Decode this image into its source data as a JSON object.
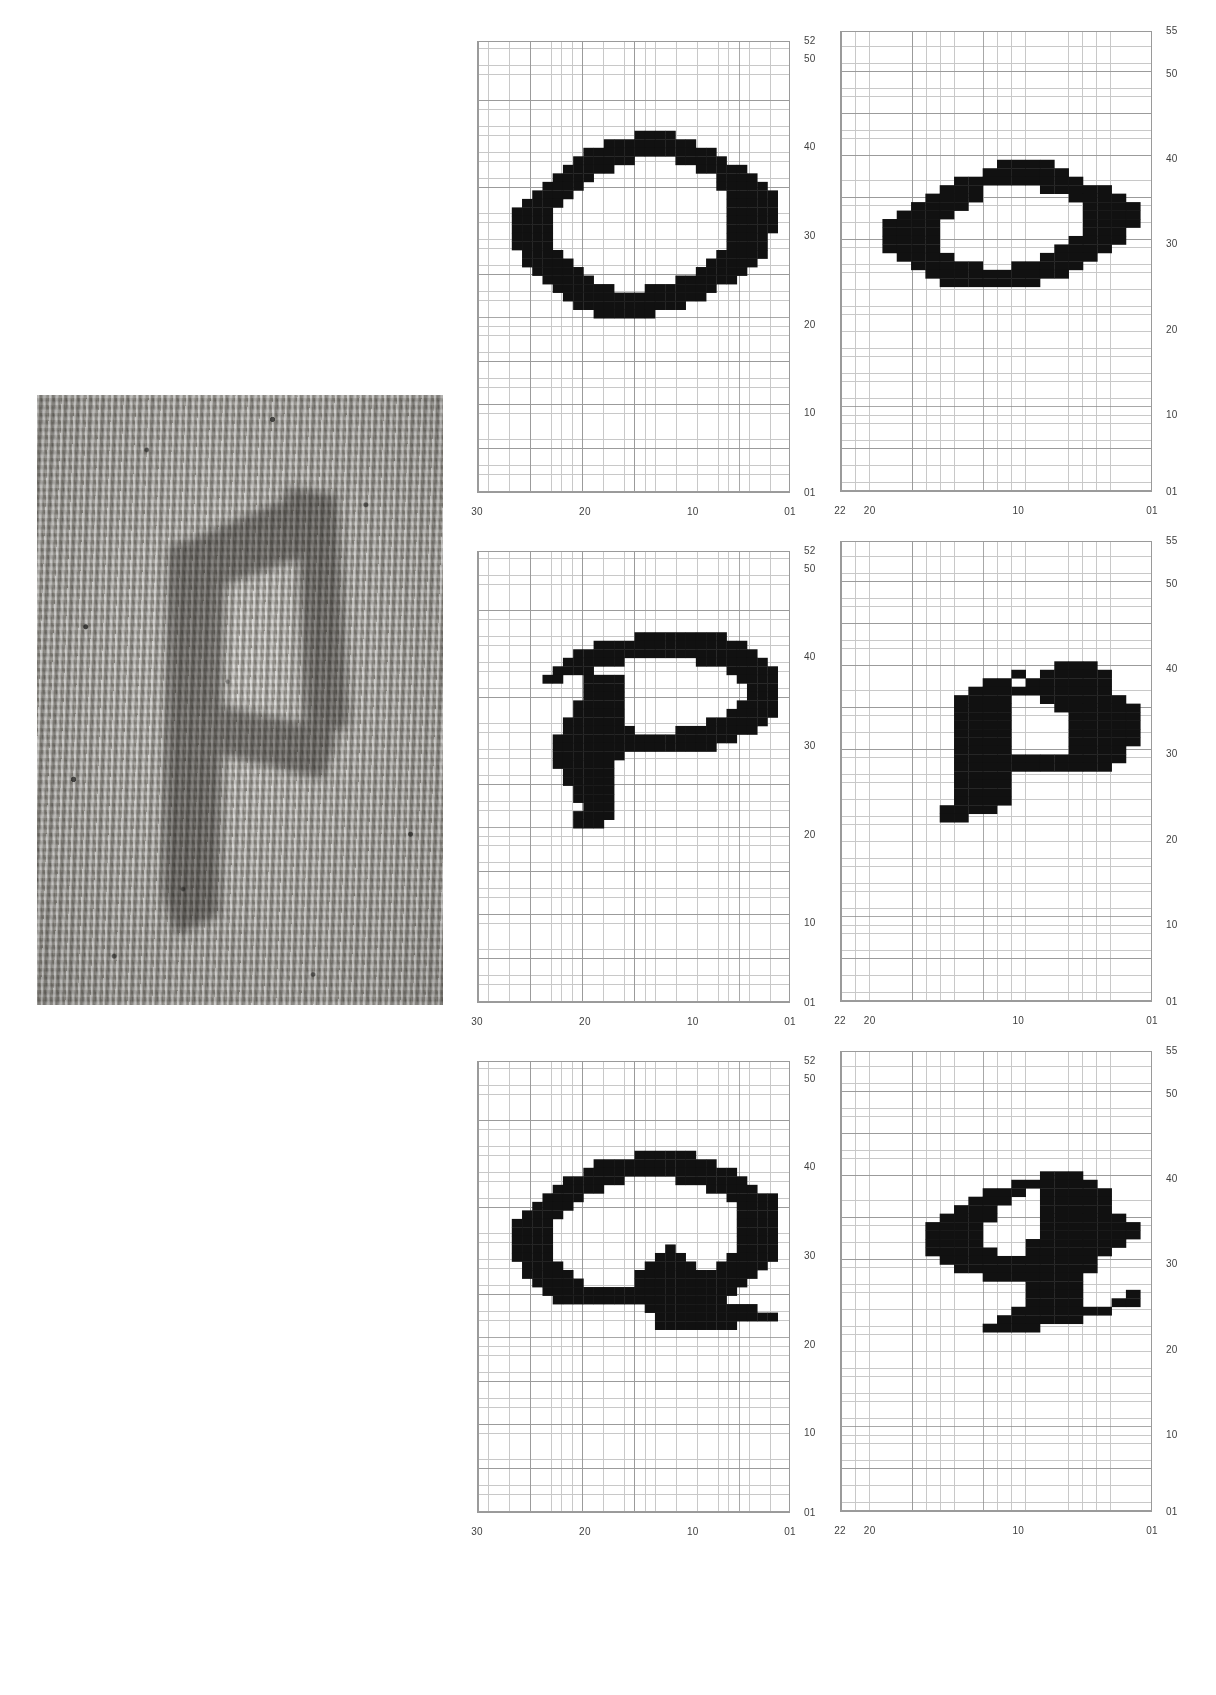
{
  "figure": {
    "background_color": "#ffffff",
    "cell_color": "#111111",
    "grid_minor_color": "#c8c8c8",
    "grid_major_color": "#8c8c8c",
    "axis_text_color": "#3f3f3f"
  },
  "photo": {
    "name": "knitted-fabric-swatch",
    "description": "Grayscale photograph of a stockinette knitted fabric swatch with a dark knitted lowercase p letterform",
    "letter_depicted": "p"
  },
  "charts": [
    {
      "id": "chart-O-upper",
      "glyph": "O",
      "case": "uppercase",
      "row": 0,
      "column": 0,
      "x_ticks": [
        "30",
        "20",
        "10",
        "01"
      ],
      "y_ticks": [
        "52",
        "50",
        "40",
        "30",
        "20",
        "10",
        "01"
      ],
      "x_range": [
        1,
        30
      ],
      "y_range": [
        1,
        52
      ],
      "grid": true
    },
    {
      "id": "chart-o-lower",
      "glyph": "o",
      "case": "lowercase",
      "row": 0,
      "column": 1,
      "x_ticks": [
        "22",
        "20",
        "10",
        "01"
      ],
      "y_ticks": [
        "55",
        "50",
        "40",
        "30",
        "20",
        "10",
        "01"
      ],
      "x_range": [
        1,
        22
      ],
      "y_range": [
        1,
        55
      ],
      "grid": true
    },
    {
      "id": "chart-P-upper",
      "glyph": "P",
      "case": "uppercase",
      "row": 1,
      "column": 0,
      "x_ticks": [
        "30",
        "20",
        "10",
        "01"
      ],
      "y_ticks": [
        "52",
        "50",
        "40",
        "30",
        "20",
        "10",
        "01"
      ],
      "x_range": [
        1,
        30
      ],
      "y_range": [
        1,
        52
      ],
      "grid": true
    },
    {
      "id": "chart-p-lower",
      "glyph": "p",
      "case": "lowercase",
      "row": 1,
      "column": 1,
      "x_ticks": [
        "22",
        "20",
        "10",
        "01"
      ],
      "y_ticks": [
        "55",
        "50",
        "40",
        "30",
        "20",
        "10",
        "01"
      ],
      "x_range": [
        1,
        22
      ],
      "y_range": [
        1,
        55
      ],
      "grid": true
    },
    {
      "id": "chart-Q-upper",
      "glyph": "Q",
      "case": "uppercase",
      "row": 2,
      "column": 0,
      "x_ticks": [
        "30",
        "20",
        "10",
        "01"
      ],
      "y_ticks": [
        "52",
        "50",
        "40",
        "30",
        "20",
        "10",
        "01"
      ],
      "x_range": [
        1,
        30
      ],
      "y_range": [
        1,
        52
      ],
      "grid": true
    },
    {
      "id": "chart-q-lower",
      "glyph": "q",
      "case": "lowercase",
      "row": 2,
      "column": 1,
      "x_ticks": [
        "22",
        "20",
        "10",
        "01"
      ],
      "y_ticks": [
        "55",
        "50",
        "40",
        "30",
        "20",
        "10",
        "01"
      ],
      "x_range": [
        1,
        22
      ],
      "y_range": [
        1,
        55
      ],
      "grid": true
    }
  ],
  "chart_data": {
    "type": "heatmap",
    "title": "",
    "xlabel": "",
    "ylabel": "",
    "panels": [
      {
        "name": "O",
        "xlim": [
          1,
          30
        ],
        "ylim": [
          1,
          52
        ],
        "xticks": [
          30,
          20,
          10,
          1
        ],
        "xticklabels": [
          "30",
          "20",
          "10",
          "01"
        ],
        "yticks": [
          52,
          50,
          40,
          30,
          20,
          10,
          1
        ],
        "yticklabels": [
          "52",
          "50",
          "40",
          "30",
          "20",
          "10",
          "01"
        ],
        "filled_cell_count": 118
      },
      {
        "name": "o",
        "xlim": [
          1,
          22
        ],
        "ylim": [
          1,
          55
        ],
        "xticks": [
          22,
          20,
          10,
          1
        ],
        "xticklabels": [
          "22",
          "20",
          "10",
          "01"
        ],
        "yticks": [
          55,
          50,
          40,
          30,
          20,
          10,
          1
        ],
        "yticklabels": [
          "55",
          "50",
          "40",
          "30",
          "20",
          "10",
          "01"
        ],
        "filled_cell_count": 84
      },
      {
        "name": "P",
        "xlim": [
          1,
          30
        ],
        "ylim": [
          1,
          52
        ],
        "xticks": [
          30,
          20,
          10,
          1
        ],
        "xticklabels": [
          "30",
          "20",
          "10",
          "01"
        ],
        "yticks": [
          52,
          50,
          40,
          30,
          20,
          10,
          1
        ],
        "yticklabels": [
          "52",
          "50",
          "40",
          "30",
          "20",
          "10",
          "01"
        ],
        "filled_cell_count": 132
      },
      {
        "name": "p",
        "xlim": [
          1,
          22
        ],
        "ylim": [
          1,
          55
        ],
        "xticks": [
          22,
          20,
          10,
          1
        ],
        "xticklabels": [
          "22",
          "20",
          "10",
          "01"
        ],
        "yticks": [
          55,
          50,
          40,
          30,
          20,
          10,
          1
        ],
        "yticklabels": [
          "55",
          "50",
          "40",
          "30",
          "20",
          "10",
          "01"
        ],
        "filled_cell_count": 110
      },
      {
        "name": "Q",
        "xlim": [
          1,
          30
        ],
        "ylim": [
          1,
          52
        ],
        "xticks": [
          30,
          20,
          10,
          1
        ],
        "xticklabels": [
          "30",
          "20",
          "10",
          "01"
        ],
        "yticks": [
          52,
          50,
          40,
          30,
          20,
          10,
          1
        ],
        "yticklabels": [
          "52",
          "50",
          "40",
          "30",
          "20",
          "10",
          "01"
        ],
        "filled_cell_count": 140
      },
      {
        "name": "q",
        "xlim": [
          1,
          22
        ],
        "ylim": [
          1,
          55
        ],
        "xticks": [
          22,
          20,
          10,
          1
        ],
        "xticklabels": [
          "22",
          "20",
          "10",
          "01"
        ],
        "yticks": [
          55,
          50,
          40,
          30,
          20,
          10,
          1
        ],
        "yticklabels": [
          "55",
          "50",
          "40",
          "30",
          "20",
          "10",
          "01"
        ],
        "filled_cell_count": 126
      }
    ]
  },
  "glyph_bitmaps": {
    "O": [
      "............................",
      "............................",
      "..............XXXX..........",
      "...........XXXXXXXXX........",
      ".........XXXXXXXXXXXXX......",
      "........XXXXXX....XXXXX.....",
      ".......XXXXX........XXXXX...",
      "......XXXX............XXXX..",
      ".....XXXX.............XXXXX.",
      "....XXXX...............XXXXX",
      "...XXXX................XXXXX",
      "..XXXX.................XXXXX",
      "..XXXX.................XXXXX",
      "..XXXX.................XXXXX",
      "..XXXX.................XXXX.",
      "..XXXX.................XXXX.",
      "...XXXX...............XXXXX.",
      "...XXXXX.............XXXXX..",
      "....XXXXX...........XXXXX...",
      ".....XXXXX........XXXXXX....",
      "......XXXXXX...XXXXXXX......",
      ".......XXXXXXXXXXXXXX.......",
      "........XXXXXXXXXXX.........",
      "..........XXXXXX............",
      "............................"
    ],
    "o": [
      "....................",
      "....................",
      "..........XXXX......",
      ".........XXXXXX.....",
      ".......XXXXXXXXX....",
      "......XXX....XXXXX..",
      ".....XXXX......XXXX.",
      "....XXXX........XXXX",
      "...XXXX.........XXXX",
      "..XXXX..........XXXX",
      "..XXXX..........XXX.",
      "..XXXX.........XXXX.",
      "..XXXX........XXXX..",
      "...XXXX......XXXX...",
      "....XXXXX..XXXXX....",
      ".....XXXXXXXXXX.....",
      "......XXXXXXX.......",
      "....................",
      "....................",
      "...................."
    ],
    "P": [
      "............................",
      "..............XXXXXXXXX.....",
      "..........XXXXXXXXXXXXXXX...",
      "........XXXXXXXXXXXXXXXXXX..",
      ".......XXXXXX.......XXXXXXX.",
      "......XXXX.............XXXXX",
      ".....XX..XXXX...........XXXX",
      ".........XXXX............XXX",
      ".........XXXX............XXX",
      "........XXXXX...........XXXX",
      "........XXXXX..........XXXXX",
      ".......XXXXXX........XXXXXX.",
      ".......XXXXXXX....XXXXXXXX..",
      "......XXXXXXXXXXXXXXXXXX....",
      "......XXXXXXXXXXXXXXXX......",
      "......XXXXXXX...............",
      "......XXXXXX................",
      ".......XXXXX................",
      ".......XXXXX................",
      "........XXXX................",
      "........XXXX................",
      ".........XXX................",
      "........XXXX................",
      "........XXX.................",
      "............................"
    ],
    "p": [
      "....................",
      "..............XXX...",
      "...........X.XXXXX..",
      ".........XX.XXXXXX..",
      "........XXXXXXXXXX..",
      ".......XXXX..XXXXXX.",
      ".......XXXX...XXXXXX",
      ".......XXXX....XXXXX",
      ".......XXXX....XXXXX",
      ".......XXXX....XXXXX",
      ".......XXXX....XXXXX",
      ".......XXXX....XXXX.",
      ".......XXXXXXXXXXXX.",
      ".......XXXXXXXXXXX..",
      ".......XXXX.........",
      ".......XXXX.........",
      ".......XXXX.........",
      ".......XXXX.........",
      "......XXXX..........",
      "......XX............"
    ],
    "Q": [
      "............................",
      "............................",
      "..............XXXXXX........",
      "..........XXXXXXXXXXXX......",
      ".........XXXXXXXXXXXXXXX....",
      ".......XXXXXX.....XXXXXXX...",
      "......XXXXX..........XXXXX..",
      ".....XXXX..............XXXXX",
      "....XXXX................XXXX",
      "...XXXX.................XXXX",
      "..XXXX..................XXXX",
      "..XXXX..................XXXX",
      "..XXXX..................XXXX",
      "..XXXX...........X......XXXX",
      "..XXXX..........XXX....XXXXX",
      "...XXXX........XXXXX..XXXXX.",
      "...XXXXX......XXXXXXXXXXXX..",
      "....XXXXX.....XXXXXXXXXXX...",
      ".....XXXXXXXXXXXXXXXXXXX....",
      "......XXXXXXXXXXXXXXXXX.....",
      "...............XXXXXXXXXXX..",
      "................XXXXXXXXXXXX",
      "................XXXXXXXX....",
      "............................",
      "............................"
    ],
    "q": [
      "....................",
      ".............XXX....",
      "...........XXXXXX...",
      ".........XXX.XXXXX..",
      "........XXX..XXXXX..",
      ".......XXX...XXXXX..",
      "......XXXX...XXXXXX.",
      ".....XXXX....XXXXXXX",
      ".....XXXX....XXXXXXX",
      ".....XXXX...XXXXXXX.",
      ".....XXXXX..XXXXXX..",
      "......XXXXXXXXXXX...",
      ".......XXXXXXXXXX...",
      ".........XXXXXXX....",
      "............XXXX....",
      "............XXXX...X",
      "............XXXX..XX",
      "...........XXXXXXX..",
      "..........XXXXXX....",
      ".........XXXX......."
    ]
  }
}
